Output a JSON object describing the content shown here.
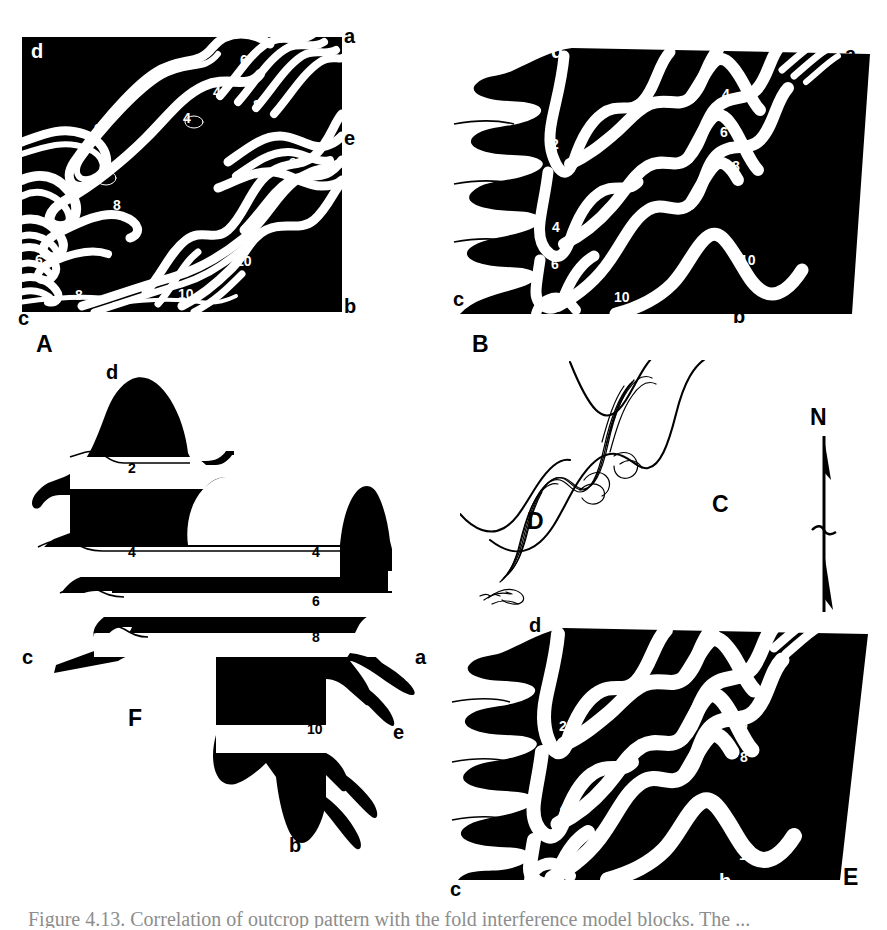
{
  "figure": {
    "background_color": "#ffffff",
    "ink_color": "#000000",
    "width": 887,
    "height": 930,
    "caption": "Figure 4.13. Correlation of outcrop pattern with the fold interference model blocks. The ..."
  },
  "panels": [
    {
      "id": "A",
      "label": "A",
      "type": "map-view-folded-surface",
      "corner_labels": [
        {
          "text": "d",
          "color": "white",
          "x": 33,
          "y": 47
        },
        {
          "text": "a",
          "color": "black",
          "x": 346,
          "y": 32
        },
        {
          "text": "e",
          "color": "black",
          "x": 346,
          "y": 134
        },
        {
          "text": "b",
          "color": "black",
          "x": 346,
          "y": 300
        },
        {
          "text": "c",
          "color": "black",
          "x": 20,
          "y": 314
        }
      ],
      "marker_numbers": [
        {
          "text": "2",
          "color": "white",
          "x": 97,
          "y": 127
        },
        {
          "text": "4",
          "color": "white",
          "x": 186,
          "y": 116
        },
        {
          "text": "4",
          "color": "white",
          "x": 216,
          "y": 89
        },
        {
          "text": "6",
          "color": "white",
          "x": 243,
          "y": 57
        },
        {
          "text": "8",
          "color": "white",
          "x": 256,
          "y": 102
        },
        {
          "text": "8",
          "color": "white",
          "x": 292,
          "y": 160
        },
        {
          "text": "8",
          "color": "white",
          "x": 116,
          "y": 203
        },
        {
          "text": "4",
          "color": "white",
          "x": 52,
          "y": 223
        },
        {
          "text": "6",
          "color": "white",
          "x": 38,
          "y": 258
        },
        {
          "text": "8",
          "color": "white",
          "x": 78,
          "y": 293
        },
        {
          "text": "10",
          "color": "white",
          "x": 242,
          "y": 259
        },
        {
          "text": "10",
          "color": "white",
          "x": 184,
          "y": 292
        }
      ]
    },
    {
      "id": "B",
      "label": "B",
      "type": "block-diagram-folded-layers",
      "corner_labels": [
        {
          "text": "d",
          "color": "white",
          "x": 553,
          "y": 47
        },
        {
          "text": "a",
          "color": "black",
          "x": 847,
          "y": 50
        },
        {
          "text": "e",
          "color": "black",
          "x": 816,
          "y": 111
        },
        {
          "text": "b",
          "color": "black",
          "x": 735,
          "y": 312
        },
        {
          "text": "c",
          "color": "black",
          "x": 455,
          "y": 295
        }
      ],
      "marker_numbers": [
        {
          "text": "2",
          "color": "white",
          "x": 553,
          "y": 142
        },
        {
          "text": "4",
          "color": "white",
          "x": 724,
          "y": 92
        },
        {
          "text": "6",
          "color": "white",
          "x": 722,
          "y": 130
        },
        {
          "text": "8",
          "color": "white",
          "x": 734,
          "y": 164
        },
        {
          "text": "4",
          "color": "white",
          "x": 554,
          "y": 225
        },
        {
          "text": "6",
          "color": "white",
          "x": 553,
          "y": 262
        },
        {
          "text": "8",
          "color": "white",
          "x": 555,
          "y": 297
        },
        {
          "text": "10",
          "color": "white",
          "x": 620,
          "y": 295
        },
        {
          "text": "10",
          "color": "white",
          "x": 746,
          "y": 258
        }
      ]
    },
    {
      "id": "C",
      "label": "C",
      "type": "line-trace-outcrop",
      "label_pos": {
        "x": 712,
        "y": 503
      }
    },
    {
      "id": "D",
      "label": "D",
      "type": "line-trace-outcrop",
      "label_pos": {
        "x": 527,
        "y": 520
      }
    },
    {
      "id": "E",
      "label": "E",
      "type": "block-diagram-folded-layers",
      "corner_labels": [
        {
          "text": "d",
          "color": "black",
          "x": 531,
          "y": 621
        },
        {
          "text": "a",
          "color": "black",
          "x": 854,
          "y": 641
        },
        {
          "text": "e",
          "color": "black",
          "x": 826,
          "y": 707
        },
        {
          "text": "b",
          "color": "white",
          "x": 721,
          "y": 877
        },
        {
          "text": "c",
          "color": "black",
          "x": 452,
          "y": 885
        }
      ],
      "marker_numbers": [
        {
          "text": "2",
          "color": "white",
          "x": 561,
          "y": 724
        },
        {
          "text": "4",
          "color": "white",
          "x": 741,
          "y": 679
        },
        {
          "text": "6",
          "color": "white",
          "x": 742,
          "y": 722
        },
        {
          "text": "8",
          "color": "white",
          "x": 742,
          "y": 755
        },
        {
          "text": "4",
          "color": "white",
          "x": 562,
          "y": 805
        },
        {
          "text": "6",
          "color": "white",
          "x": 564,
          "y": 851
        },
        {
          "text": "8",
          "color": "white",
          "x": 565,
          "y": 888
        },
        {
          "text": "10",
          "color": "white",
          "x": 745,
          "y": 853
        }
      ]
    },
    {
      "id": "F",
      "label": "F",
      "type": "flattened-unfolded-surface",
      "label_pos": {
        "x": 128,
        "y": 708
      },
      "corner_labels": [
        {
          "text": "d",
          "color": "black",
          "x": 108,
          "y": 368
        },
        {
          "text": "a",
          "color": "black",
          "x": 417,
          "y": 653
        },
        {
          "text": "e",
          "color": "black",
          "x": 395,
          "y": 728
        },
        {
          "text": "b",
          "color": "black",
          "x": 291,
          "y": 841
        },
        {
          "text": "c",
          "color": "black",
          "x": 24,
          "y": 653
        }
      ],
      "marker_numbers": [
        {
          "text": "2",
          "color": "black",
          "x": 131,
          "y": 466
        },
        {
          "text": "4",
          "color": "black",
          "x": 131,
          "y": 550
        },
        {
          "text": "4",
          "color": "black",
          "x": 315,
          "y": 550
        },
        {
          "text": "6",
          "color": "black",
          "x": 315,
          "y": 599
        },
        {
          "text": "8",
          "color": "black",
          "x": 315,
          "y": 635
        },
        {
          "text": "10",
          "color": "black",
          "x": 313,
          "y": 727
        }
      ]
    }
  ],
  "north_arrow": {
    "label": "N",
    "label_pos": {
      "x": 816,
      "y": 414
    },
    "x": 817,
    "y": 440,
    "height": 172
  },
  "marker_horizons": [
    "2",
    "4",
    "6",
    "8",
    "10"
  ],
  "corner_letters": [
    "a",
    "b",
    "c",
    "d",
    "e"
  ],
  "panel_labels": [
    "A",
    "B",
    "C",
    "D",
    "E",
    "F"
  ]
}
